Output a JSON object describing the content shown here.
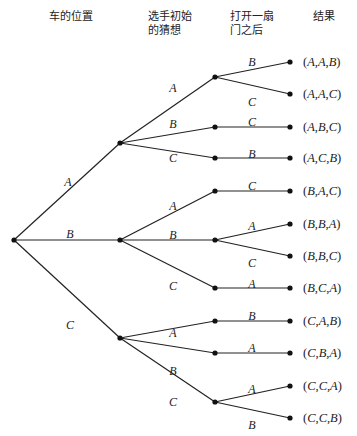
{
  "headers": {
    "car_position": "车的位置",
    "initial_guess_line1": "选手初始",
    "initial_guess_line2": "的猜想",
    "after_open_line1": "打开一扇",
    "after_open_line2": "门之后",
    "result": "结果"
  },
  "tree": {
    "root": {
      "x": 14,
      "y": 240
    },
    "level1": [
      {
        "label": "A",
        "x": 120,
        "y": 143,
        "label_x": 68,
        "label_y": 182
      },
      {
        "label": "B",
        "x": 120,
        "y": 240,
        "label_x": 70,
        "label_y": 234
      },
      {
        "label": "C",
        "x": 120,
        "y": 338,
        "label_x": 70,
        "label_y": 325
      }
    ],
    "level2": [
      {
        "parent": 0,
        "label": "A",
        "x": 215,
        "y": 77,
        "label_x": 173,
        "label_y": 88
      },
      {
        "parent": 0,
        "label": "B",
        "x": 215,
        "y": 127,
        "label_x": 173,
        "label_y": 124
      },
      {
        "parent": 0,
        "label": "C",
        "x": 215,
        "y": 158,
        "label_x": 173,
        "label_y": 158
      },
      {
        "parent": 1,
        "label": "A",
        "x": 215,
        "y": 191,
        "label_x": 173,
        "label_y": 206
      },
      {
        "parent": 1,
        "label": "B",
        "x": 215,
        "y": 240,
        "label_x": 173,
        "label_y": 235
      },
      {
        "parent": 1,
        "label": "C",
        "x": 215,
        "y": 288,
        "label_x": 173,
        "label_y": 286
      },
      {
        "parent": 2,
        "label": "A",
        "x": 215,
        "y": 321,
        "label_x": 173,
        "label_y": 333
      },
      {
        "parent": 2,
        "label": "B",
        "x": 215,
        "y": 353,
        "label_x": 173,
        "label_y": 371
      },
      {
        "parent": 2,
        "label": "C",
        "x": 215,
        "y": 402,
        "label_x": 173,
        "label_y": 402
      }
    ],
    "leaves": [
      {
        "parent": 0,
        "label": "B",
        "x": 290,
        "y": 62,
        "label_x": 252,
        "label_y": 62,
        "result": [
          "A",
          "A",
          "B"
        ]
      },
      {
        "parent": 0,
        "label": "C",
        "x": 290,
        "y": 94,
        "label_x": 252,
        "label_y": 102,
        "result": [
          "A",
          "A",
          "C"
        ]
      },
      {
        "parent": 1,
        "label": "C",
        "x": 290,
        "y": 127,
        "label_x": 252,
        "label_y": 122,
        "result": [
          "A",
          "B",
          "C"
        ]
      },
      {
        "parent": 2,
        "label": "B",
        "x": 290,
        "y": 158,
        "label_x": 252,
        "label_y": 154,
        "result": [
          "A",
          "C",
          "B"
        ]
      },
      {
        "parent": 3,
        "label": "C",
        "x": 290,
        "y": 191,
        "label_x": 252,
        "label_y": 186,
        "result": [
          "B",
          "A",
          "C"
        ]
      },
      {
        "parent": 4,
        "label": "A",
        "x": 290,
        "y": 224,
        "label_x": 252,
        "label_y": 226,
        "result": [
          "B",
          "B",
          "A"
        ]
      },
      {
        "parent": 4,
        "label": "C",
        "x": 290,
        "y": 256,
        "label_x": 252,
        "label_y": 263,
        "result": [
          "B",
          "B",
          "C"
        ]
      },
      {
        "parent": 5,
        "label": "A",
        "x": 290,
        "y": 288,
        "label_x": 252,
        "label_y": 284,
        "result": [
          "B",
          "C",
          "A"
        ]
      },
      {
        "parent": 6,
        "label": "B",
        "x": 290,
        "y": 321,
        "label_x": 252,
        "label_y": 316,
        "result": [
          "C",
          "A",
          "B"
        ]
      },
      {
        "parent": 7,
        "label": "A",
        "x": 290,
        "y": 353,
        "label_x": 252,
        "label_y": 348,
        "result": [
          "C",
          "B",
          "A"
        ]
      },
      {
        "parent": 8,
        "label": "A",
        "x": 290,
        "y": 386,
        "label_x": 252,
        "label_y": 389,
        "result": [
          "C",
          "C",
          "A"
        ]
      },
      {
        "parent": 8,
        "label": "B",
        "x": 290,
        "y": 418,
        "label_x": 252,
        "label_y": 425,
        "result": [
          "C",
          "C",
          "B"
        ]
      }
    ]
  }
}
